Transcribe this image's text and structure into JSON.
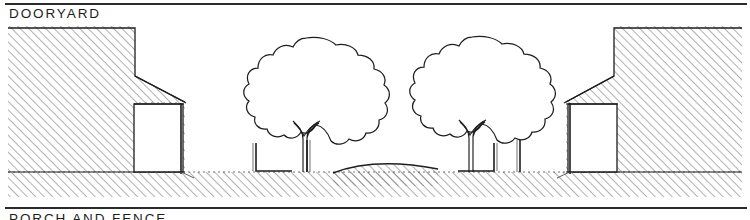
{
  "sheet": {
    "title": "DOORYARD",
    "next_section_title": "PORCH AND FENCE",
    "drawing_type": "architectural street section",
    "ink_color": "#1d1d1d",
    "hatch_color": "#6f6f6f",
    "paper_color": "#ffffff"
  },
  "drawing": {
    "caption": "DOORYARD",
    "elements": {
      "left_building_label": "left building mass",
      "left_porch_label": "left porch",
      "right_building_label": "right building mass",
      "right_porch_label": "right porch",
      "tree_left_label": "street tree left",
      "tree_right_label": "street tree right",
      "curb_left_label": "left curb and fence post",
      "curb_right_label": "right curb and fence post",
      "roadway_label": "crowned roadway",
      "ground_label": "ground plane"
    },
    "hatch": {
      "angle_degrees": 45,
      "spacing_px": 6,
      "stroke_width_px": 1.1
    }
  }
}
